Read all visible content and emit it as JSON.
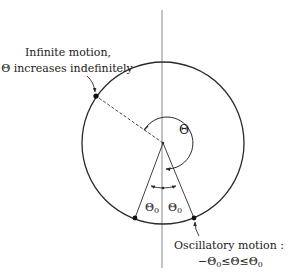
{
  "diagram": {
    "colors": {
      "stroke": "#2a2a2a",
      "axis": "#6a6a6a",
      "background": "#ffffff"
    },
    "annotations": {
      "infinite_line1": "Infinite motion,",
      "infinite_line2": "Θ increases indefinitely",
      "oscillatory_line1": "Oscillatory motion :",
      "oscillatory_ineq_minus": "−Θ",
      "oscillatory_ineq_mid": "≤Θ≤Θ",
      "oscillatory_sub": "0"
    },
    "symbols": {
      "theta": "Θ",
      "theta0_left": "Θ",
      "theta0_right": "Θ",
      "sub0": "0"
    },
    "geometry": {
      "circle_center": [
        163,
        143
      ],
      "circle_radius": 81,
      "vertical_axis": {
        "x": 162,
        "y1": 10,
        "y2": 268
      },
      "points": {
        "infinite": [
          96,
          96
        ],
        "osc_left": [
          135,
          218
        ],
        "osc_right": [
          194,
          218
        ]
      }
    }
  }
}
